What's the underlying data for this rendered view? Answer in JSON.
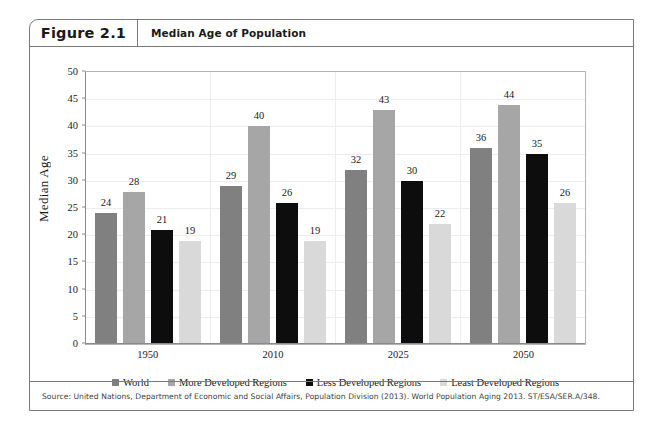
{
  "figure": {
    "number": "Figure 2.1",
    "title": "Median Age of Population",
    "source": "Source: United Nations, Department of Economic and Social Affairs, Population Division (2013). World Population Aging 2013. ST/ESA/SER.A/348."
  },
  "chart_data": {
    "type": "bar",
    "title": "Median Age of Population",
    "xlabel": "",
    "ylabel": "Median Age",
    "ylim": [
      0,
      50
    ],
    "yticks": [
      0,
      5,
      10,
      15,
      20,
      25,
      30,
      35,
      40,
      45,
      50
    ],
    "grid": true,
    "legend_position": "bottom",
    "categories": [
      "1950",
      "2010",
      "2025",
      "2050"
    ],
    "series": [
      {
        "name": "World",
        "color": "#808080",
        "values": [
          24,
          29,
          32,
          36
        ]
      },
      {
        "name": "More Developed Regions",
        "color": "#a6a6a6",
        "values": [
          28,
          40,
          43,
          44
        ]
      },
      {
        "name": "Less Developed Regions",
        "color": "#0d0d0d",
        "values": [
          21,
          26,
          30,
          35
        ]
      },
      {
        "name": "Least Developed Regions",
        "color": "#d9d9d9",
        "values": [
          19,
          19,
          22,
          26
        ]
      }
    ]
  }
}
